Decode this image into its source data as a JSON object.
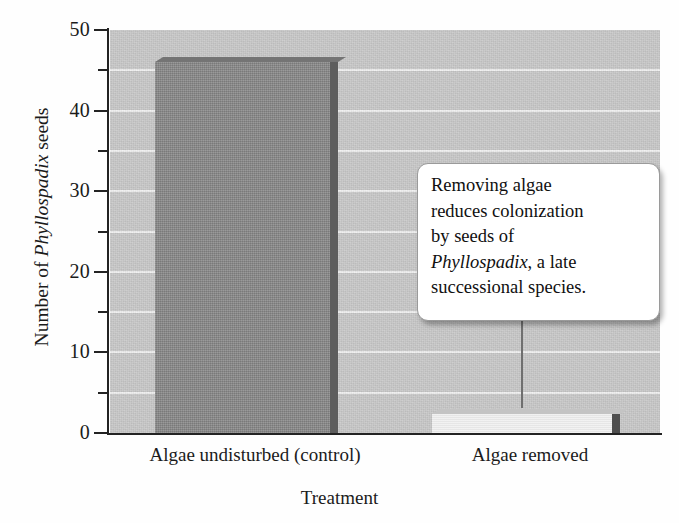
{
  "chart_data": {
    "type": "bar",
    "title": "",
    "xlabel": "Treatment",
    "ylabel": "Number of Phyllospadix seeds",
    "ylabel_parts": {
      "prefix": "Number of ",
      "italic": "Phyllospadix",
      "suffix": " seeds"
    },
    "categories": [
      "Algae undisturbed (control)",
      "Algae removed"
    ],
    "values": [
      46,
      2.3
    ],
    "ylim": [
      0,
      50
    ],
    "ytick_major": [
      0,
      10,
      20,
      30,
      40,
      50
    ],
    "ytick_minor": [
      5,
      15,
      25,
      35,
      45
    ],
    "ytick_labels": [
      "0",
      "10",
      "20",
      "30",
      "40",
      "50"
    ],
    "gridlines": [
      5,
      10,
      15,
      20,
      25,
      30,
      35,
      40,
      45
    ],
    "grid": true,
    "legend": "none",
    "bar_colors": [
      "#8b8b8b",
      "#ededed"
    ],
    "plot_background": "#c9c9c9",
    "gridline_color": "#f3f3f3",
    "axis_color": "#232323",
    "annotations": [
      {
        "text": "Removing algae reduces colonization by seeds of Phyllospadix, a late successional species.",
        "lines": [
          {
            "plain": "Removing algae"
          },
          {
            "plain": "reduces colonization"
          },
          {
            "plain": "by seeds of"
          },
          {
            "italic": "Phyllospadix",
            "plain": ", a late"
          },
          {
            "plain": "successional species."
          }
        ],
        "points_to": "Algae removed"
      }
    ]
  },
  "annotation_box": {
    "line1": "Removing algae",
    "line2": "reduces colonization",
    "line3": "by seeds of",
    "line4_italic": "Phyllospadix",
    "line4_rest": ", a late",
    "line5": "successional species."
  },
  "axis": {
    "y_title_prefix": "Number of ",
    "y_title_italic": "Phyllospadix",
    "y_title_suffix": " seeds",
    "x_title": "Treatment"
  },
  "ticks": {
    "labels": [
      "50",
      "40",
      "30",
      "20",
      "10",
      "0"
    ]
  },
  "categories": {
    "c0": "Algae undisturbed (control)",
    "c1": "Algae removed"
  }
}
